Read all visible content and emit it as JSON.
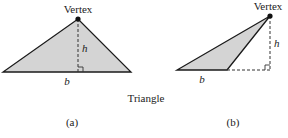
{
  "figure": {
    "caption": "Triangle",
    "colors": {
      "fill": "#d4d4d4",
      "stroke": "#1a1a1a",
      "dash": "#333333",
      "vertex_dot": "#111111"
    },
    "panels": [
      {
        "id": "a",
        "label": "(a)",
        "vertex_label": "Vertex",
        "height_label": "h",
        "base_label": "b",
        "points": {
          "left": [
            3,
            72
          ],
          "right": [
            131,
            72
          ],
          "vertex": [
            78,
            19
          ]
        },
        "height_foot": [
          78,
          72
        ],
        "right_angle_marker": true
      },
      {
        "id": "b",
        "label": "(b)",
        "vertex_label": "Vertex",
        "height_label": "h",
        "base_label": "b",
        "points": {
          "left": [
            177,
            70
          ],
          "right": [
            227,
            70
          ],
          "vertex": [
            270,
            16
          ]
        },
        "height_foot": [
          270,
          70
        ],
        "base_extension": [
          [
            227,
            70
          ],
          [
            270,
            70
          ]
        ],
        "right_angle_marker": true
      }
    ]
  }
}
